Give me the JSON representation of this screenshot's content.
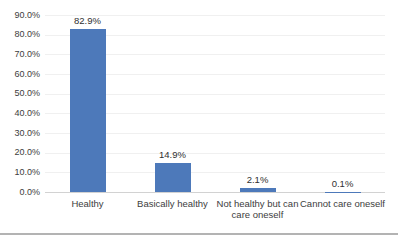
{
  "page": {
    "background_color": "#ffffff",
    "bottom_border_color": "#b3b3b3"
  },
  "chart_data": {
    "type": "bar",
    "title": "",
    "xlabel": "",
    "ylabel": "",
    "legend": "none",
    "grid": true,
    "categories": [
      "Healthy",
      "Basically healthy",
      "Not healthy but can care oneself",
      "Cannot care oneself"
    ],
    "values": [
      82.9,
      14.9,
      2.1,
      0.1
    ],
    "data_labels": [
      "82.9%",
      "14.9%",
      "2.1%",
      "0.1%"
    ],
    "y_ticks": [
      "90.0%",
      "80.0%",
      "70.0%",
      "60.0%",
      "50.0%",
      "40.0%",
      "30.0%",
      "20.0%",
      "10.0%",
      "0.0%"
    ],
    "ylim": [
      0,
      90
    ],
    "bar_color": "#4d79ba",
    "gridline_color": "#f0f0f0",
    "axis_line_color": "#d2d2d2",
    "text_color": "#3d3d3d"
  }
}
